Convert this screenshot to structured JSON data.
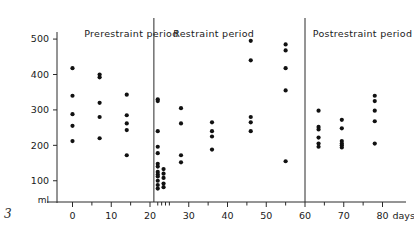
{
  "figure": {
    "number": "3",
    "y_unit_label": "ml",
    "x_unit_label": "days"
  },
  "periods": [
    {
      "key": "prerestraint",
      "label": "Prerestraint period"
    },
    {
      "key": "restraint",
      "label": "Restraint period"
    },
    {
      "key": "postrestraint",
      "label": "Postrestraint period"
    }
  ],
  "chart_data": {
    "type": "scatter",
    "title": "",
    "xlabel": "days",
    "ylabel": "ml",
    "xlim": [
      -4,
      84
    ],
    "ylim": [
      40,
      520
    ],
    "grid": false,
    "legend": null,
    "x_ticks_major": [
      0,
      10,
      20,
      30,
      40,
      50,
      60,
      70,
      80
    ],
    "x_ticks_minor": [
      5,
      15,
      22,
      23,
      24,
      25,
      35,
      45,
      55,
      65,
      75
    ],
    "x_tick_labels": [
      "0",
      "10",
      "20",
      "30",
      "40",
      "50",
      "60",
      "70",
      "80"
    ],
    "y_ticks": [
      100,
      200,
      300,
      400,
      500
    ],
    "y_tick_labels": [
      "100",
      "200",
      "300",
      "400",
      "500"
    ],
    "dividers": [
      {
        "x": 21,
        "label": "prerestraint/restraint boundary"
      },
      {
        "x": 60,
        "label": "restraint/postrestraint boundary"
      }
    ],
    "annotations": [
      {
        "text": "Prerestraint period",
        "x": 3,
        "y": 505,
        "anchor": "start"
      },
      {
        "text": "Restraint period",
        "x": 26,
        "y": 505,
        "anchor": "start"
      },
      {
        "text": "Postrestraint period",
        "x": 62,
        "y": 505,
        "anchor": "start"
      }
    ],
    "series": [
      {
        "name": "urine volume",
        "marker": "filled-circle",
        "color": "#111111",
        "points": [
          {
            "x": 0,
            "y": 418
          },
          {
            "x": 0,
            "y": 340
          },
          {
            "x": 0,
            "y": 288
          },
          {
            "x": 0,
            "y": 255
          },
          {
            "x": 0,
            "y": 212
          },
          {
            "x": 7,
            "y": 400
          },
          {
            "x": 7,
            "y": 392
          },
          {
            "x": 7,
            "y": 320
          },
          {
            "x": 7,
            "y": 280
          },
          {
            "x": 7,
            "y": 220
          },
          {
            "x": 14,
            "y": 343
          },
          {
            "x": 14,
            "y": 285
          },
          {
            "x": 14,
            "y": 262
          },
          {
            "x": 14,
            "y": 243
          },
          {
            "x": 14,
            "y": 172
          },
          {
            "x": 22,
            "y": 330
          },
          {
            "x": 22,
            "y": 325
          },
          {
            "x": 22,
            "y": 240
          },
          {
            "x": 22,
            "y": 196
          },
          {
            "x": 22,
            "y": 178
          },
          {
            "x": 22,
            "y": 148
          },
          {
            "x": 22,
            "y": 140
          },
          {
            "x": 22,
            "y": 125
          },
          {
            "x": 22,
            "y": 118
          },
          {
            "x": 22,
            "y": 112
          },
          {
            "x": 22,
            "y": 100
          },
          {
            "x": 22,
            "y": 88
          },
          {
            "x": 22,
            "y": 78
          },
          {
            "x": 23.5,
            "y": 133
          },
          {
            "x": 23.5,
            "y": 120
          },
          {
            "x": 23.5,
            "y": 108
          },
          {
            "x": 23.5,
            "y": 92
          },
          {
            "x": 23.5,
            "y": 82
          },
          {
            "x": 28,
            "y": 305
          },
          {
            "x": 28,
            "y": 262
          },
          {
            "x": 28,
            "y": 172
          },
          {
            "x": 28,
            "y": 152
          },
          {
            "x": 36,
            "y": 265
          },
          {
            "x": 36,
            "y": 240
          },
          {
            "x": 36,
            "y": 225
          },
          {
            "x": 36,
            "y": 188
          },
          {
            "x": 46,
            "y": 495
          },
          {
            "x": 46,
            "y": 440
          },
          {
            "x": 46,
            "y": 280
          },
          {
            "x": 46,
            "y": 265
          },
          {
            "x": 46,
            "y": 240
          },
          {
            "x": 55,
            "y": 485
          },
          {
            "x": 55,
            "y": 468
          },
          {
            "x": 55,
            "y": 418
          },
          {
            "x": 55,
            "y": 355
          },
          {
            "x": 55,
            "y": 155
          },
          {
            "x": 63.5,
            "y": 298
          },
          {
            "x": 63.5,
            "y": 252
          },
          {
            "x": 63.5,
            "y": 245
          },
          {
            "x": 63.5,
            "y": 222
          },
          {
            "x": 63.5,
            "y": 205
          },
          {
            "x": 63.5,
            "y": 196
          },
          {
            "x": 69.5,
            "y": 272
          },
          {
            "x": 69.5,
            "y": 248
          },
          {
            "x": 69.5,
            "y": 212
          },
          {
            "x": 69.5,
            "y": 205
          },
          {
            "x": 69.5,
            "y": 200
          },
          {
            "x": 69.5,
            "y": 194
          },
          {
            "x": 78,
            "y": 340
          },
          {
            "x": 78,
            "y": 325
          },
          {
            "x": 78,
            "y": 298
          },
          {
            "x": 78,
            "y": 268
          },
          {
            "x": 78,
            "y": 205
          }
        ]
      }
    ]
  }
}
